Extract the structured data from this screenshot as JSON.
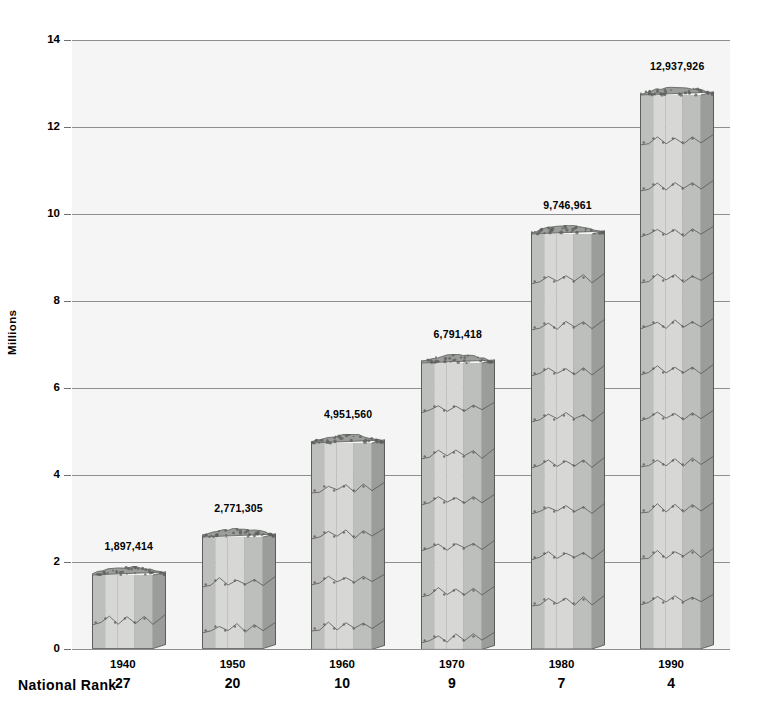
{
  "chart_data": {
    "type": "bar",
    "title": "",
    "xlabel": "",
    "ylabel": "Millions",
    "categories": [
      "1940",
      "1950",
      "1960",
      "1970",
      "1980",
      "1990"
    ],
    "values": [
      1.897414,
      2.771305,
      4.95156,
      6.791418,
      9.746961,
      12.937926
    ],
    "value_labels": [
      "1,897,414",
      "2,771,305",
      "4,951,560",
      "6,791,418",
      "9,746,961",
      "12,937,926"
    ],
    "ylim": [
      0,
      14
    ],
    "yticks": [
      0,
      2,
      4,
      6,
      8,
      10,
      12,
      14
    ],
    "ytick_labels": [
      "0",
      "2",
      "4",
      "6",
      "8",
      "10",
      "12",
      "14"
    ],
    "grid": true,
    "legend": false,
    "secondary_axis": {
      "label": "National Rank",
      "values": [
        "27",
        "20",
        "10",
        "9",
        "7",
        "4"
      ]
    }
  },
  "colors": {
    "plot_background": "#f4f5f4",
    "gridline": "#8d8f8d",
    "bar_light": "#d7d8d6",
    "bar_mid": "#bdbfbc",
    "bar_dark": "#9b9d9a",
    "bar_shadow": "#8b8d8a",
    "bar_outline": "#5b5d5a",
    "text": "#000000"
  },
  "axis": {
    "ylabel": "Millions",
    "ytick_labels": [
      "14",
      "12",
      "10",
      "8",
      "6",
      "4",
      "2",
      "0"
    ]
  },
  "footer": {
    "rank_title": "National Rank"
  }
}
